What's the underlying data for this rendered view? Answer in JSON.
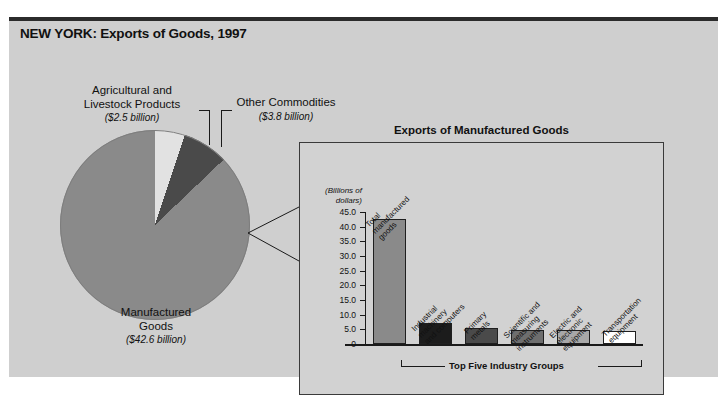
{
  "figure": {
    "title": "NEW YORK: Exports of Goods, 1997"
  },
  "pie": {
    "labels": {
      "agricultural": "Agricultural and\nLivestock Products",
      "agricultural_line1": "Agricultural and",
      "agricultural_line2": "Livestock Products",
      "agricultural_amount": "($2.5 billion)",
      "other": "Other Commodities",
      "other_amount": "($3.8 billion)",
      "manufactured_line1": "Manufactured",
      "manufactured_line2": "Goods",
      "manufactured_amount": "($42.6 billion)"
    }
  },
  "inset": {
    "title": "Exports of Manufactured Goods",
    "axis_caption_line1": "(Billions of",
    "axis_caption_line2": "dollars)",
    "bracket_label": "Top Five Industry Groups"
  },
  "chart_data": {
    "type": "bar",
    "title": "Exports of Manufactured Goods",
    "xlabel": "",
    "ylabel": "(Billions of dollars)",
    "ylim": [
      0,
      45
    ],
    "yticks": [
      "0",
      "5.0",
      "10.0",
      "15.0",
      "20.0",
      "25.0",
      "30.0",
      "35.0",
      "40.0",
      "45.0"
    ],
    "ytick_values": [
      0,
      5,
      10,
      15,
      20,
      25,
      30,
      35,
      40,
      45
    ],
    "grid": false,
    "categories": [
      "Total manufactured goods",
      "Industrial machinery and computers",
      "Primary metals",
      "Scientific and measuring instruments",
      "Electric and electronic equipment",
      "Transportation equipment"
    ],
    "category_lines": [
      [
        "Total",
        "manufactured",
        "goods"
      ],
      [
        "Industrial",
        "machinery",
        "and computers"
      ],
      [
        "Primary",
        "metals"
      ],
      [
        "Scientific and",
        "measuring",
        "instruments"
      ],
      [
        "Electric and",
        "electronic",
        "equipment"
      ],
      [
        "Transportation",
        "equipment"
      ]
    ],
    "values": [
      42.6,
      7.2,
      5.6,
      4.8,
      4.7,
      4.3
    ],
    "colors": [
      "#8a8a8a",
      "#1c1c1c",
      "#4a4a4a",
      "#6e6e6e",
      "#a8a8a8",
      "#ffffff"
    ],
    "annotation": "Top Five Industry Groups",
    "annotation_covers": [
      1,
      2,
      3,
      4,
      5
    ]
  },
  "pie_data": {
    "type": "pie",
    "title": "Exports of Goods, 1997",
    "labels": [
      "Manufactured Goods",
      "Agricultural and Livestock Products",
      "Other Commodities"
    ],
    "values": [
      42.6,
      2.5,
      3.8
    ],
    "unit": "billion dollars",
    "colors": [
      "#8a8a8a",
      "#e2e2e2",
      "#4a4a4a"
    ]
  },
  "style": {
    "background": "#cfcfcf",
    "inset_background": "#d2d2d2",
    "ink": "#111111"
  }
}
